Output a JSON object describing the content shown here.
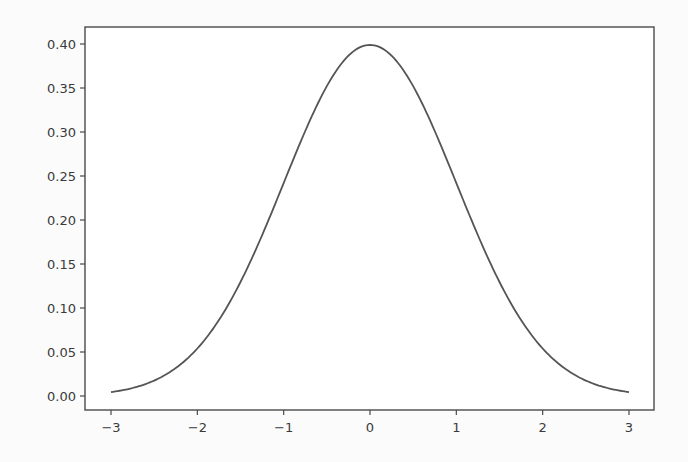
{
  "chart_data": {
    "type": "line",
    "title": "",
    "xlabel": "",
    "ylabel": "",
    "xlim": [
      -3.3,
      3.3
    ],
    "ylim": [
      -0.02,
      0.42
    ],
    "grid": false,
    "legend": null,
    "xticks": [
      -3,
      -2,
      -1,
      0,
      1,
      2,
      3
    ],
    "xtick_labels": [
      "−3",
      "−2",
      "−1",
      "0",
      "1",
      "2",
      "3"
    ],
    "yticks": [
      0.0,
      0.05,
      0.1,
      0.15,
      0.2,
      0.25,
      0.3,
      0.35,
      0.4
    ],
    "ytick_labels": [
      "0.00",
      "0.05",
      "0.10",
      "0.15",
      "0.20",
      "0.25",
      "0.30",
      "0.35",
      "0.40"
    ],
    "series": [
      {
        "name": "Standard normal PDF",
        "color": "#555555",
        "x": [
          -3.0,
          -2.75,
          -2.5,
          -2.25,
          -2.0,
          -1.75,
          -1.5,
          -1.25,
          -1.0,
          -0.75,
          -0.5,
          -0.25,
          0.0,
          0.25,
          0.5,
          0.75,
          1.0,
          1.25,
          1.5,
          1.75,
          2.0,
          2.25,
          2.5,
          2.75,
          3.0
        ],
        "y": [
          0.0044,
          0.0091,
          0.0175,
          0.0317,
          0.054,
          0.0863,
          0.1295,
          0.1826,
          0.242,
          0.3011,
          0.3521,
          0.3867,
          0.3989,
          0.3867,
          0.3521,
          0.3011,
          0.242,
          0.1826,
          0.1295,
          0.0863,
          0.054,
          0.0317,
          0.0175,
          0.0091,
          0.0044
        ]
      }
    ]
  },
  "layout": {
    "plot_px": {
      "x0": 111,
      "x1": 629,
      "y0": 396,
      "y1": 44
    },
    "frame_px": {
      "left": 85,
      "top": 27,
      "right": 654,
      "bottom": 410
    }
  }
}
